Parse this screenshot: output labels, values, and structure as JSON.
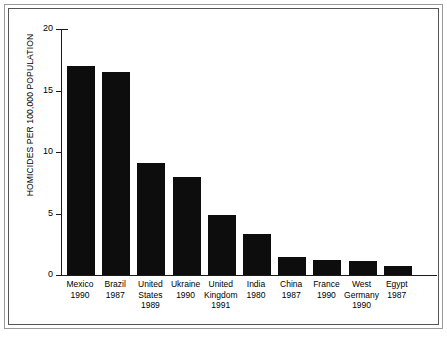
{
  "chart_data": {
    "type": "bar",
    "title": "",
    "subtitle": "",
    "xlabel": "",
    "ylabel": "HOMICIDES PER 100,000 POPULATION",
    "ylim": [
      0,
      20
    ],
    "yticks": [
      0,
      5,
      10,
      15,
      20
    ],
    "ytick_labels": [
      "0",
      "5",
      "10",
      "15",
      "20"
    ],
    "grid": false,
    "legend": false,
    "bar_color": "#0d0d0d",
    "categories": [
      "Mexico 1990",
      "Brazil 1987",
      "United States 1989",
      "Ukraine 1990",
      "United Kingdom 1991",
      "India 1980",
      "China 1987",
      "France 1990",
      "West Germany 1990",
      "Egypt 1987"
    ],
    "values": [
      17.0,
      16.5,
      9.1,
      8.0,
      4.9,
      3.3,
      1.5,
      1.2,
      1.1,
      0.7
    ],
    "bars": [
      {
        "country": "Mexico",
        "year": "1990",
        "value": 17.0,
        "label_lines": [
          "Mexico",
          "1990"
        ]
      },
      {
        "country": "Brazil",
        "year": "1987",
        "value": 16.5,
        "label_lines": [
          "Brazil",
          "1987"
        ]
      },
      {
        "country": "United States",
        "year": "1989",
        "value": 9.1,
        "label_lines": [
          "United",
          "States",
          "1989"
        ]
      },
      {
        "country": "Ukraine",
        "year": "1990",
        "value": 8.0,
        "label_lines": [
          "Ukraine",
          "1990"
        ]
      },
      {
        "country": "United Kingdom",
        "year": "1991",
        "value": 4.9,
        "label_lines": [
          "United",
          "Kingdom",
          "1991"
        ]
      },
      {
        "country": "India",
        "year": "1980",
        "value": 3.3,
        "label_lines": [
          "India",
          "1980"
        ]
      },
      {
        "country": "China",
        "year": "1987",
        "value": 1.5,
        "label_lines": [
          "China",
          "1987"
        ]
      },
      {
        "country": "France",
        "year": "1990",
        "value": 1.2,
        "label_lines": [
          "France",
          "1990"
        ]
      },
      {
        "country": "West Germany",
        "year": "1990",
        "value": 1.1,
        "label_lines": [
          "West",
          "Germany",
          "1990"
        ]
      },
      {
        "country": "Egypt",
        "year": "1987",
        "value": 0.7,
        "label_lines": [
          "Egypt",
          "1987"
        ]
      }
    ]
  }
}
